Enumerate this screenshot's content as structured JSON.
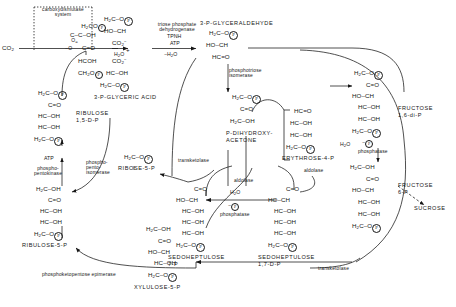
{
  "diagram": {
    "type": "biochemical-pathway-diagram",
    "background": "#ffffff",
    "line_color": "#161616"
  },
  "boxes": {
    "carboxydismutase_system": "carboxydismutase\nsystem"
  },
  "inputs": {
    "co2": "CO2"
  },
  "compounds": {
    "glyceraldehyde_3p": "3-P-GLYCERALDEHYDE",
    "glyceric_acid_3p": "3-P-GLYCERIC ACID",
    "ribulose_15dp": "RIBULOSE\n1,5-D-P",
    "ribulose_5p": "RIBULOSE-5-P",
    "ribose_5p": "RIBOSE-5-P",
    "xylulose_5p": "XYLULOSE-5-P",
    "dihydroxyacetone_p": "P-DIHYDROXY-\nACETONE",
    "erythrose_4p": "ERYTHROSE-4-P",
    "fructose_16dp": "FRUCTOSE\n1,6-di-P",
    "fructose_6p": "FRUCTOSE\n6-P",
    "sedoheptulose_7p": "SEDOHEPTULOSE\n7-P",
    "sedoheptulose_17dp": "SEDOHEPTULOSE\n1,7-D-P",
    "sucrose": "SUCROSE"
  },
  "enzymes": {
    "triose_phosphate_dehydrogenase": "triose phosphate\ndehydrogenase",
    "phosphotriose_isomerase": "phosphotriose\nisomerase",
    "aldolase_left": "aldolase",
    "aldolase_right": "aldolase",
    "phosphatase_fructose": "phosphatase",
    "phosphatase_sedoheptulose": "phosphatase",
    "transketolase_mid": "transketolase",
    "transketolase_bottom": "transketolase",
    "phosphopentokinase": "phospho-\npentokinase",
    "phosphopentoisomerase": "phospho-\npento-\nisomerase",
    "phosphoketopentose_epimerase": "phosphoketopentose epimerase"
  },
  "cofactors": {
    "tpnh": "TPNH",
    "atp_top": "ATP",
    "atp_left": "ATP",
    "minus_h2o": "-H2O",
    "h2o_carboxy": "H2O",
    "h2o_fructose": "H2O",
    "h2o_sedoheptulose": "H2O",
    "minus_p_fructose": "-P",
    "minus_p_sedoheptulose": "-P"
  },
  "structures": {
    "carboxy_intermediate": [
      "H2C O  P",
      "O=C-C-OH",
      "-O    C=O",
      "HCOH",
      "CH2O P"
    ],
    "glyceric_3p_left": [
      "H2C-O  P",
      "HO-CH",
      "CO2-"
    ],
    "glyceric_3p_right": [
      "CO2-",
      "HC-OH",
      "H2C-O  P"
    ],
    "glyceraldehyde_3p": [
      "H2C-O  P",
      "HO-CH",
      "HC=O"
    ],
    "ribulose_15dp": [
      "H2C-O  P",
      "C=O",
      "HC-OH",
      "HC-OH",
      "H2C-O  P"
    ],
    "ribulose_5p": [
      "H2C-OH",
      "C=O",
      "HC-OH",
      "HC-OH",
      "H2C-O  P"
    ],
    "ribose_5p": [
      "H2C-O  P"
    ],
    "dhap": [
      "H2C-O  P",
      "C=O",
      "H2C-OH"
    ],
    "erythrose_4p": [
      "HC=O",
      "HC-OH",
      "HC-OH",
      "H2C-O  P"
    ],
    "fructose_16dp": [
      "H2C-O  P",
      "C=O",
      "HO-CH",
      "HC-OH",
      "HC-OH",
      "H2C-O  P"
    ],
    "fructose_6p": [
      "H2C-OH",
      "C=O",
      "HO-CH",
      "HC-OH",
      "HC-OH",
      "H2C-O  P"
    ],
    "sedoheptulose_7p": [
      "C=O",
      "HO-CH",
      "HC-OH",
      "HC-OH",
      "HC-OH",
      "H2C-O  P"
    ],
    "sedoheptulose_17dp": [
      "C=O",
      "HO-CH",
      "HC-OH",
      "HC-OH",
      "HC-OH",
      "H2C-O  P"
    ],
    "xylulose_5p": [
      "H2C-OH",
      "C=O",
      "HO-CH",
      "HC-OH",
      "H2C-O  P"
    ]
  }
}
